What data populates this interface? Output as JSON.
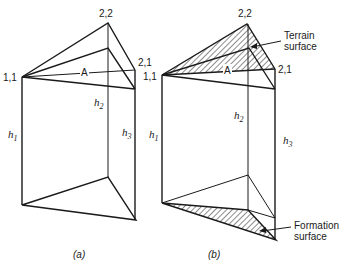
{
  "figure": {
    "panel_a": {
      "caption": "(a)",
      "vertex_labels": {
        "top": "2,2",
        "right": "2,1",
        "left": "1,1",
        "area": "A"
      },
      "heights": {
        "h1": "h",
        "h1_sub": "1",
        "h2": "h",
        "h2_sub": "2",
        "h3": "h",
        "h3_sub": "3"
      }
    },
    "panel_b": {
      "caption": "(b)",
      "vertex_labels": {
        "top": "2,2",
        "right": "2,1",
        "left": "1,1",
        "area": "A"
      },
      "heights": {
        "h1": "h",
        "h1_sub": "1",
        "h2": "h",
        "h2_sub": "2",
        "h3": "h",
        "h3_sub": "3"
      },
      "annotations": {
        "terrain_line1": "Terrain",
        "terrain_line2": "surface",
        "formation_line1": "Formation",
        "formation_line2": "surface"
      }
    }
  }
}
